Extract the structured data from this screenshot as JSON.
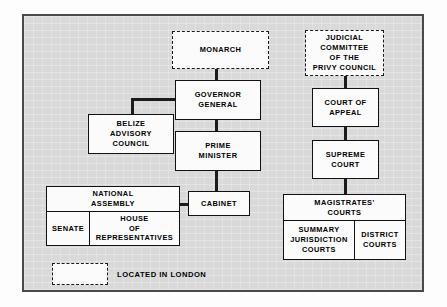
{
  "diagram": {
    "frame": {
      "background": "#d9d9d9",
      "border_color": "#4a4a4a"
    },
    "node_colors": {
      "fill": "#fbfbfb",
      "stroke": "#111111",
      "connector": "#1b1b1b"
    },
    "nodes": {
      "monarch": {
        "label": "MONARCH",
        "style": "dashed"
      },
      "governor_general": {
        "label": "GOVERNOR\nGENERAL",
        "style": "solid"
      },
      "belize_advisory_council": {
        "label": "BELIZE\nADVISORY\nCOUNCIL",
        "style": "solid"
      },
      "prime_minister": {
        "label": "PRIME\nMINISTER",
        "style": "solid"
      },
      "cabinet": {
        "label": "CABINET",
        "style": "solid"
      },
      "judicial_committee": {
        "label": "JUDICIAL\nCOMMITTEE\nOF THE\nPRIVY COUNCIL",
        "style": "dashed"
      },
      "court_of_appeal": {
        "label": "COURT OF\nAPPEAL",
        "style": "solid"
      },
      "supreme_court": {
        "label": "SUPREME\nCOURT",
        "style": "solid"
      }
    },
    "national_assembly": {
      "header": "NATIONAL\nASSEMBLY",
      "chambers": [
        {
          "label": "SENATE"
        },
        {
          "label": "HOUSE\nOF\nREPRESENTATIVES"
        }
      ]
    },
    "magistrates_courts": {
      "header": "MAGISTRATES'\nCOURTS",
      "divisions": [
        {
          "label": "SUMMARY\nJURISDICTION\nCOURTS"
        },
        {
          "label": "DISTRICT\nCOURTS"
        }
      ]
    },
    "legend": {
      "swatch_style": "dashed",
      "text": "LOCATED IN LONDON"
    }
  }
}
